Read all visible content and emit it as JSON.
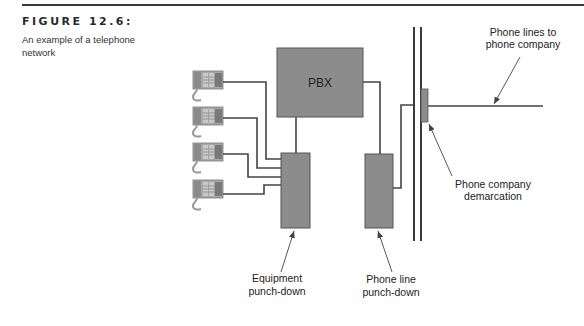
{
  "figure": {
    "number_label": "FIGURE 12.6:",
    "caption": "An example of a telephone network"
  },
  "diagram": {
    "colors": {
      "box_fill": "#8c8c8c",
      "box_stroke": "#555555",
      "line": "#444444",
      "phone": "#9a9a9a"
    },
    "nodes": {
      "pbx": {
        "label": "PBX"
      },
      "phones": [
        {
          "label": "Telephone 1"
        },
        {
          "label": "Telephone 2"
        },
        {
          "label": "Telephone 3"
        },
        {
          "label": "Telephone 4"
        }
      ],
      "equipment_punch_down": {
        "label": "Equipment punch-down"
      },
      "phone_line_punch_down": {
        "label": "Phone line punch-down"
      },
      "demarcation": {
        "label": "Phone company demarcation"
      }
    },
    "labels": {
      "equipment_line1": "Equipment",
      "equipment_line2": "punch-down",
      "phoneline_line1": "Phone line",
      "phoneline_line2": "punch-down",
      "demarc_line1": "Phone company",
      "demarc_line2": "demarcation",
      "lines_line1": "Phone lines to",
      "lines_line2": "phone company"
    },
    "edges": [
      {
        "from": "Telephone 1",
        "to": "Equipment punch-down"
      },
      {
        "from": "Telephone 2",
        "to": "Equipment punch-down"
      },
      {
        "from": "Telephone 3",
        "to": "Equipment punch-down"
      },
      {
        "from": "Telephone 4",
        "to": "Equipment punch-down"
      },
      {
        "from": "Equipment punch-down",
        "to": "PBX"
      },
      {
        "from": "PBX",
        "to": "Phone line punch-down"
      },
      {
        "from": "Phone line punch-down",
        "to": "Phone company demarcation"
      },
      {
        "from": "Phone company demarcation",
        "to": "Phone lines to phone company"
      }
    ]
  }
}
